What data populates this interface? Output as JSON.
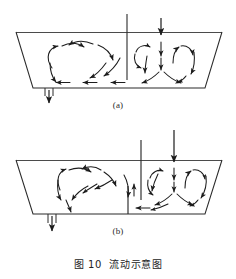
{
  "figure": {
    "caption": "图 10  流动示意图",
    "caption_number": "图 10",
    "caption_title": "流动示意图",
    "panels": [
      {
        "id": "a",
        "label": "(a)",
        "description": "trapezoidal-vessel-flow-pattern-single-baffle",
        "vessel": {
          "shape": "trapezoid",
          "rim_y": 32,
          "floor_y": 88,
          "top_left_x": 16,
          "top_right_x": 222,
          "bottom_left_x": 33,
          "bottom_right_x": 205
        },
        "baffles": [
          {
            "name": "center-baffle",
            "x": 127,
            "y_top": 14,
            "y_bottom": 80
          }
        ],
        "inlet_arrows": [
          {
            "name": "top-inlet-arrow",
            "x": 161,
            "y_start": 18,
            "y_end": 34
          }
        ],
        "outlet": {
          "name": "bottom-drain",
          "x": 49,
          "y_top": 88,
          "y_bottom": 104
        }
      },
      {
        "id": "b",
        "label": "(b)",
        "description": "trapezoidal-vessel-flow-pattern-double-baffle",
        "vessel": {
          "shape": "trapezoid",
          "rim_y": 160,
          "floor_y": 214,
          "top_left_x": 16,
          "top_right_x": 222,
          "bottom_left_x": 33,
          "bottom_right_x": 205
        },
        "baffles": [
          {
            "name": "upper-baffle",
            "x": 141,
            "y_top": 140,
            "y_bottom": 200
          },
          {
            "name": "lower-baffle",
            "x": 128,
            "y_top": 186,
            "y_bottom": 214
          }
        ],
        "inlet_arrows": [
          {
            "name": "top-inlet-arrow",
            "x": 174,
            "y_start": 130,
            "y_end": 162
          }
        ],
        "outlet": {
          "name": "bottom-drain",
          "x": 52,
          "y_top": 214,
          "y_bottom": 232
        }
      }
    ],
    "colors": {
      "stroke": "#2b2b2b",
      "arrow": "#1c1c1c",
      "background": "#ffffff",
      "text": "#232323"
    }
  }
}
